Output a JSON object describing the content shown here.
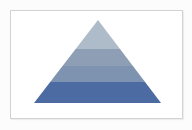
{
  "canvas": {
    "background_color": "#fcfcfc"
  },
  "card": {
    "background_color": "#ffffff",
    "border_color": "#d2d2d2"
  },
  "pyramid": {
    "type": "pyramid-diagram",
    "description": "Four-level pyramid, lightest band at apex, darkest at base, no text labels",
    "levels": [
      {
        "position": "top",
        "color": "#aebbc9"
      },
      {
        "position": "upper-middle",
        "color": "#8d9eb5"
      },
      {
        "position": "lower-middle",
        "color": "#7e93af"
      },
      {
        "position": "base",
        "color": "#4d6ba3"
      }
    ]
  }
}
